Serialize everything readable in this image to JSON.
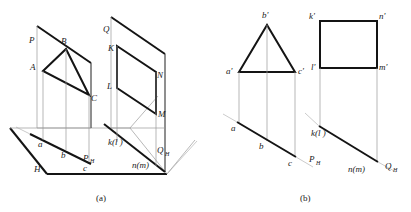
{
  "figure": {
    "panels": [
      {
        "id": "a",
        "caption": "(a)",
        "description": "pictorial-view",
        "labels": {
          "plane_p": "P",
          "plane_q": "Q",
          "plane_h": "H",
          "trace_ph": "P",
          "trace_ph_sub": "H",
          "trace_qh": "Q",
          "trace_qh_sub": "H",
          "vertex_A": "A",
          "vertex_B": "B",
          "vertex_C": "C",
          "vertex_K": "K",
          "vertex_L": "L",
          "vertex_M": "M",
          "vertex_N": "N",
          "proj_a": "a",
          "proj_b": "b",
          "proj_c": "c",
          "proj_kl": "k(l )",
          "proj_nm": "n(m)"
        }
      },
      {
        "id": "b",
        "caption": "(b)",
        "description": "orthographic-projection",
        "labels": {
          "vertex_a_prime": "a'",
          "vertex_b_prime": "b'",
          "vertex_c_prime": "c'",
          "vertex_k_prime": "k'",
          "vertex_l_prime": "l'",
          "vertex_m_prime": "m'",
          "vertex_n_prime": "n'",
          "proj_a": "a",
          "proj_b": "b",
          "proj_c": "c",
          "proj_kl": "k(l )",
          "proj_nm": "n(m)",
          "trace_ph": "P",
          "trace_ph_sub": "H",
          "trace_qh": "Q",
          "trace_qh_sub": "H"
        }
      }
    ],
    "colors": {
      "line_dark": "#141414",
      "line_thin": "#9a9a9a",
      "background": "#ffffff",
      "text": "#1a1a1a"
    }
  }
}
